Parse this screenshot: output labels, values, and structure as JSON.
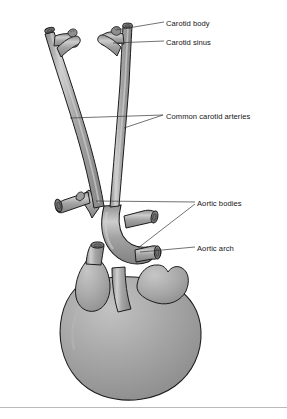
{
  "figure": {
    "style": "grayscale-anatomical-line-illustration",
    "background_color": "#ffffff",
    "vessel_fill_color": "#9a9a9a",
    "vessel_outline_color": "#1c1c1c",
    "heart_fill_color": "#a3a3a3",
    "highlight_color": "#d6d6d6",
    "leader_line_color": "#3a3a3a",
    "label_text_color": "#151515"
  },
  "labels": [
    {
      "id": "carotid-body",
      "text": "Carotid body"
    },
    {
      "id": "carotid-sinus",
      "text": "Carotid sinus"
    },
    {
      "id": "common-carotid",
      "text": "Common carotid arteries"
    },
    {
      "id": "aortic-bodies",
      "text": "Aortic bodies"
    },
    {
      "id": "aortic-arch",
      "text": "Aortic arch"
    }
  ],
  "structures": [
    {
      "id": "left-common-carotid-artery",
      "name": "Left common carotid artery"
    },
    {
      "id": "right-common-carotid-artery",
      "name": "Right common carotid artery"
    },
    {
      "id": "left-carotid-bifurcation",
      "name": "Left carotid bifurcation"
    },
    {
      "id": "right-carotid-bifurcation",
      "name": "Right carotid bifurcation"
    },
    {
      "id": "carotid-body-nodule-left",
      "name": "Left carotid body nodule"
    },
    {
      "id": "carotid-body-nodule-right",
      "name": "Right carotid body nodule"
    },
    {
      "id": "aortic-arch-vessel",
      "name": "Aortic arch"
    },
    {
      "id": "brachiocephalic-trunk",
      "name": "Brachiocephalic trunk"
    },
    {
      "id": "subclavian-stub-left",
      "name": "Left subclavian artery stub"
    },
    {
      "id": "subclavian-stub-right",
      "name": "Right subclavian artery stub"
    },
    {
      "id": "ascending-aorta-stub",
      "name": "Ascending aorta cut end"
    },
    {
      "id": "superior-vena-cava",
      "name": "Superior vena cava"
    },
    {
      "id": "pulmonary-trunk",
      "name": "Pulmonary trunk"
    },
    {
      "id": "right-atrial-appendage",
      "name": "Right atrial appendage"
    },
    {
      "id": "left-atrial-appendage",
      "name": "Left atrial appendage"
    },
    {
      "id": "ventricular-mass",
      "name": "Ventricular mass of heart"
    }
  ],
  "footer": {
    "rule": "horizontal-divider"
  }
}
